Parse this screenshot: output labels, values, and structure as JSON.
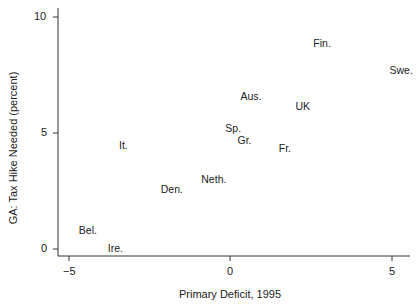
{
  "chart_data": {
    "type": "scatter",
    "title": "",
    "xlabel": "Primary Deficit, 1995",
    "ylabel": "GA: Tax Hike Needed (percent)",
    "xlim": [
      -5.5,
      5.6
    ],
    "ylim": [
      -0.5,
      10.4
    ],
    "xticks": [
      -5,
      0,
      5
    ],
    "yticks": [
      0,
      5,
      10
    ],
    "xtick_labels": [
      "−5",
      "0",
      "5"
    ],
    "ytick_labels": [
      "0",
      "5",
      "10"
    ],
    "grid": false,
    "legend": null,
    "marker": "text labels",
    "points": [
      {
        "label": "Bel.",
        "x": -4.4,
        "y": 0.8
      },
      {
        "label": "Ire.",
        "x": -3.55,
        "y": 0.05
      },
      {
        "label": "It.",
        "x": -3.3,
        "y": 4.5
      },
      {
        "label": "Den.",
        "x": -1.8,
        "y": 2.6
      },
      {
        "label": "Neth.",
        "x": -0.5,
        "y": 3.0
      },
      {
        "label": "Sp.",
        "x": 0.1,
        "y": 5.2
      },
      {
        "label": "Gr.",
        "x": 0.45,
        "y": 4.7
      },
      {
        "label": "Fr.",
        "x": 1.7,
        "y": 4.35
      },
      {
        "label": "Aus.",
        "x": 0.65,
        "y": 6.6
      },
      {
        "label": "UK",
        "x": 2.25,
        "y": 6.15
      },
      {
        "label": "Fin.",
        "x": 2.85,
        "y": 8.9
      },
      {
        "label": "Swe.",
        "x": 5.3,
        "y": 7.7
      }
    ]
  }
}
